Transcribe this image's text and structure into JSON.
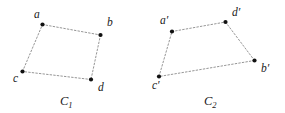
{
  "figure": {
    "background_color": "#ffffff",
    "edge_color": "#8a8a8a",
    "vertex_color": "#111111",
    "label_color": "#1a1a1a",
    "width": 285,
    "height": 113,
    "shapes": [
      {
        "id": "C1",
        "caption_letter": "C",
        "caption_subscript": "1",
        "caption_x": 60,
        "caption_y": 105,
        "vertices": [
          {
            "key": "a",
            "label": "a",
            "x": 42.5,
            "y": 24.5,
            "label_x": 34,
            "label_y": 18
          },
          {
            "key": "b",
            "label": "b",
            "x": 100.5,
            "y": 35.0,
            "label_x": 107,
            "label_y": 26
          },
          {
            "key": "c",
            "label": "c",
            "x": 22.5,
            "y": 71.5,
            "label_x": 13,
            "label_y": 82
          },
          {
            "key": "d",
            "label": "d",
            "x": 91.0,
            "y": 79.5,
            "label_x": 98,
            "label_y": 91
          }
        ],
        "edges": [
          {
            "from": "a",
            "to": "b"
          },
          {
            "from": "b",
            "to": "d"
          },
          {
            "from": "d",
            "to": "c"
          },
          {
            "from": "c",
            "to": "a"
          }
        ]
      },
      {
        "id": "C2",
        "caption_letter": "C",
        "caption_subscript": "2",
        "caption_x": 204,
        "caption_y": 105,
        "vertices": [
          {
            "key": "a'",
            "label": "a′",
            "x": 172.0,
            "y": 31.5,
            "label_x": 160,
            "label_y": 24
          },
          {
            "key": "d'",
            "label": "d′",
            "x": 225.5,
            "y": 22.0,
            "label_x": 232,
            "label_y": 16
          },
          {
            "key": "b'",
            "label": "b′",
            "x": 254.5,
            "y": 60.5,
            "label_x": 261,
            "label_y": 72
          },
          {
            "key": "c'",
            "label": "c′",
            "x": 159.0,
            "y": 76.5,
            "label_x": 152,
            "label_y": 89
          }
        ],
        "edges": [
          {
            "from": "a'",
            "to": "d'"
          },
          {
            "from": "d'",
            "to": "b'"
          },
          {
            "from": "b'",
            "to": "c'"
          },
          {
            "from": "c'",
            "to": "a'"
          }
        ]
      }
    ]
  }
}
